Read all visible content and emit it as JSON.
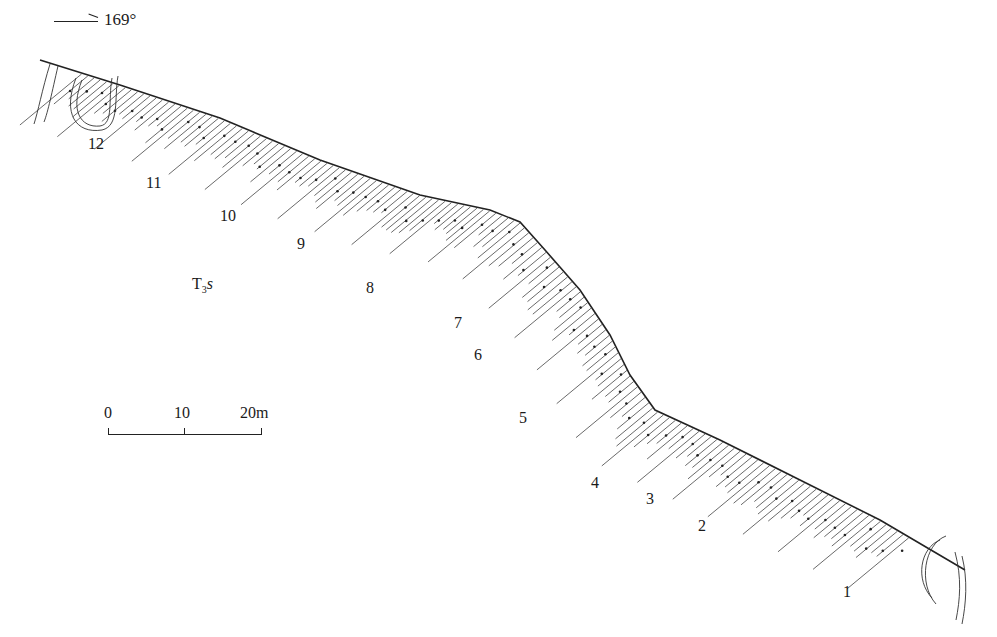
{
  "orientation": {
    "arrow_icon": "right-arrow-icon",
    "bearing": "169°"
  },
  "formation": {
    "symbol": "T",
    "subscript": "3",
    "suffix": "s"
  },
  "scale_bar": {
    "ticks": [
      "0",
      "10",
      "20m"
    ]
  },
  "layers": [
    {
      "id": "12",
      "x": 88,
      "y": 136
    },
    {
      "id": "11",
      "x": 146,
      "y": 175
    },
    {
      "id": "10",
      "x": 220,
      "y": 208
    },
    {
      "id": "9",
      "x": 297,
      "y": 236
    },
    {
      "id": "8",
      "x": 366,
      "y": 280
    },
    {
      "id": "7",
      "x": 454,
      "y": 315
    },
    {
      "id": "6",
      "x": 474,
      "y": 347
    },
    {
      "id": "5",
      "x": 519,
      "y": 410
    },
    {
      "id": "4",
      "x": 591,
      "y": 475
    },
    {
      "id": "3",
      "x": 646,
      "y": 491
    },
    {
      "id": "2",
      "x": 698,
      "y": 518
    },
    {
      "id": "1",
      "x": 843,
      "y": 584
    }
  ],
  "surface_profile": [
    [
      40,
      60
    ],
    [
      120,
      85
    ],
    [
      220,
      118
    ],
    [
      320,
      160
    ],
    [
      420,
      195
    ],
    [
      490,
      210
    ],
    [
      520,
      222
    ],
    [
      545,
      250
    ],
    [
      580,
      290
    ],
    [
      610,
      335
    ],
    [
      630,
      375
    ],
    [
      655,
      410
    ],
    [
      720,
      440
    ],
    [
      800,
      480
    ],
    [
      880,
      520
    ],
    [
      965,
      570
    ]
  ],
  "colors": {
    "ink": "#222222",
    "background": "#ffffff"
  }
}
